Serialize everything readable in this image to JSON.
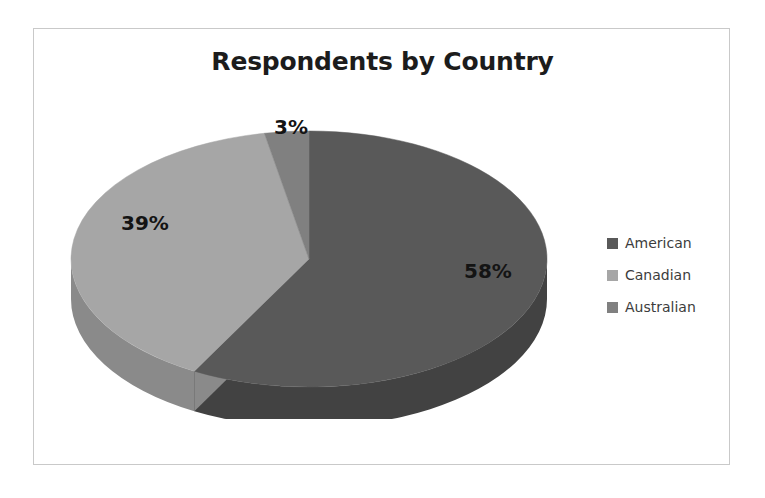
{
  "chart_data": {
    "type": "pie",
    "title": "Respondents by Country",
    "three_d": true,
    "categories": [
      "American",
      "Canadian",
      "Australian"
    ],
    "values": [
      58,
      39,
      3
    ],
    "value_labels": [
      "58%",
      "39%",
      "3%"
    ],
    "unit": "percent",
    "start_angle_deg": 0,
    "direction": "clockwise",
    "colors": [
      "#595959",
      "#a6a6a6",
      "#808080"
    ],
    "side_colors": [
      "#424242",
      "#8a8a8a",
      "#6b6b6b"
    ],
    "legend": {
      "position": "right",
      "entries": [
        {
          "label": "American",
          "color": "#595959"
        },
        {
          "label": "Canadian",
          "color": "#a6a6a6"
        },
        {
          "label": "Australian",
          "color": "#808080"
        }
      ]
    },
    "slices": [
      {
        "name": "American",
        "value": 58,
        "label": "58%",
        "color": "#595959",
        "side_color": "#424242"
      },
      {
        "name": "Canadian",
        "value": 39,
        "label": "39%",
        "color": "#a6a6a6",
        "side_color": "#8a8a8a"
      },
      {
        "name": "Australian",
        "value": 3,
        "label": "3%",
        "color": "#808080",
        "side_color": "#6b6b6b"
      }
    ],
    "grid": false,
    "xlabel": "",
    "ylabel": ""
  },
  "frame": {
    "border_color": "#c9c9c9",
    "background": "#ffffff"
  }
}
